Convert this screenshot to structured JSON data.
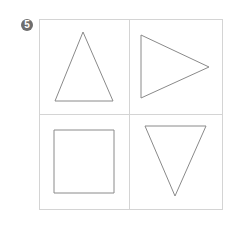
{
  "problem": {
    "number": "5",
    "badge_color": "#6e6e6e"
  },
  "grid": {
    "rows": 2,
    "cols": 2,
    "line_color": "#d4d4d4",
    "bounds": {
      "left": 39,
      "top": 19,
      "right": 222,
      "bottom": 209
    },
    "divider_x": 129,
    "divider_y": 114
  },
  "shapes": [
    {
      "cell": "top-left",
      "type": "triangle",
      "orientation": "pointing-up",
      "points": "83,32 113,101 55,101"
    },
    {
      "cell": "top-right",
      "type": "triangle",
      "orientation": "pointing-right",
      "points": "141,35 209,67 141,98"
    },
    {
      "cell": "bottom-left",
      "type": "square",
      "points": "54,130 114,130 114,193 54,193"
    },
    {
      "cell": "bottom-right",
      "type": "triangle",
      "orientation": "pointing-down",
      "points": "145,126 206,126 175,196"
    }
  ],
  "stroke_color": "#8a8a8a"
}
